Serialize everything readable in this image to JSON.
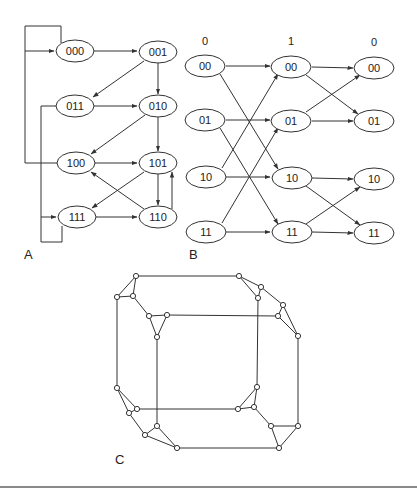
{
  "panels": {
    "A": {
      "label": "A",
      "nodes": [
        {
          "id": "000",
          "label": "000"
        },
        {
          "id": "001",
          "label": "001"
        },
        {
          "id": "011",
          "label": "011"
        },
        {
          "id": "010",
          "label": "010"
        },
        {
          "id": "100",
          "label": "100"
        },
        {
          "id": "101",
          "label": "101"
        },
        {
          "id": "111",
          "label": "111"
        },
        {
          "id": "110",
          "label": "110"
        }
      ],
      "edges": [
        [
          "000",
          "000"
        ],
        [
          "000",
          "001"
        ],
        [
          "001",
          "011"
        ],
        [
          "001",
          "010"
        ],
        [
          "011",
          "010"
        ],
        [
          "011",
          "111"
        ],
        [
          "010",
          "100"
        ],
        [
          "010",
          "101"
        ],
        [
          "100",
          "000"
        ],
        [
          "100",
          "101"
        ],
        [
          "101",
          "110"
        ],
        [
          "101",
          "111"
        ],
        [
          "110",
          "100"
        ],
        [
          "110",
          "101"
        ],
        [
          "111",
          "110"
        ],
        [
          "111",
          "111"
        ]
      ]
    },
    "B": {
      "label": "B",
      "column_labels": [
        "0",
        "1",
        "0"
      ],
      "rows": [
        "00",
        "01",
        "10",
        "11"
      ],
      "node_labels": {
        "c0": [
          "00",
          "01",
          "10",
          "11"
        ],
        "c1": [
          "00",
          "01",
          "10",
          "11"
        ],
        "c2": [
          "00",
          "01",
          "10",
          "11"
        ]
      },
      "edges_stage1": [
        [
          "00",
          "00"
        ],
        [
          "00",
          "10"
        ],
        [
          "01",
          "01"
        ],
        [
          "01",
          "11"
        ],
        [
          "10",
          "00"
        ],
        [
          "10",
          "10"
        ],
        [
          "11",
          "01"
        ],
        [
          "11",
          "11"
        ]
      ],
      "edges_stage2": [
        [
          "00",
          "00"
        ],
        [
          "00",
          "01"
        ],
        [
          "01",
          "00"
        ],
        [
          "01",
          "01"
        ],
        [
          "10",
          "10"
        ],
        [
          "10",
          "11"
        ],
        [
          "11",
          "10"
        ],
        [
          "11",
          "11"
        ]
      ]
    },
    "C": {
      "label": "C",
      "node_count": 24
    }
  }
}
